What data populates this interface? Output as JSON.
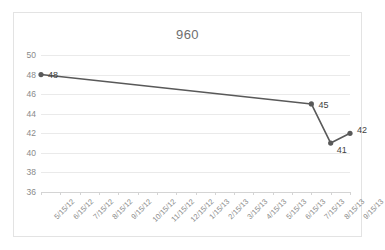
{
  "chart_data": {
    "type": "line",
    "title": "960",
    "xlabel": "",
    "ylabel": "",
    "ylim": [
      36,
      50
    ],
    "ytick_step": 2,
    "yticks": [
      50,
      48,
      46,
      44,
      42,
      40,
      38,
      36
    ],
    "grid": true,
    "legend": "none",
    "categories": [
      "5/15/12",
      "6/15/12",
      "7/15/12",
      "8/15/12",
      "9/15/12",
      "10/15/12",
      "11/15/12",
      "12/15/12",
      "1/15/13",
      "2/15/13",
      "3/15/13",
      "4/15/13",
      "5/15/13",
      "6/15/13",
      "7/15/13",
      "8/15/13",
      "9/15/13"
    ],
    "series": [
      {
        "name": "960",
        "values": [
          48,
          null,
          null,
          null,
          null,
          null,
          null,
          null,
          null,
          null,
          null,
          null,
          null,
          null,
          45,
          41,
          42
        ]
      }
    ],
    "point_labels": [
      {
        "category": "5/15/12",
        "value": 48,
        "text": "48",
        "dx": 7,
        "dy": 0
      },
      {
        "category": "7/15/13",
        "value": 45,
        "text": "45",
        "dx": 7,
        "dy": 1
      },
      {
        "category": "8/15/13",
        "value": 41,
        "text": "41",
        "dx": 6,
        "dy": 7
      },
      {
        "category": "9/15/13",
        "value": 42,
        "text": "42",
        "dx": 7,
        "dy": -3
      }
    ],
    "colors": {
      "line": "#595959",
      "marker": "#595959",
      "gridline": "#eaeaea",
      "axis": "#d4d4d4",
      "tick_text": "#8a8a8a",
      "title_text": "#6e6e6e",
      "label_text": "#3f3f3f",
      "border": "#e3e3e3",
      "background": "#ffffff"
    }
  }
}
